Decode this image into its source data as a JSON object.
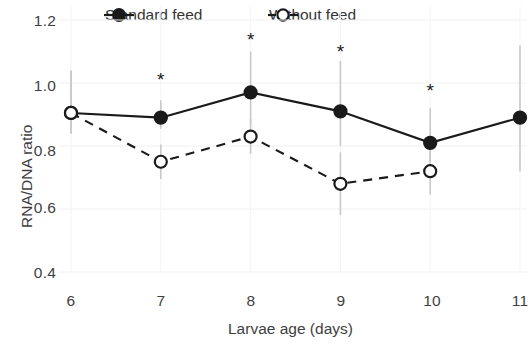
{
  "chart_data": {
    "type": "line",
    "title": "",
    "xlabel": "Larvae age (days)",
    "ylabel": "RNA/DNA ratio",
    "x": [
      6,
      7,
      8,
      9,
      10,
      11
    ],
    "xticklabels": [
      "6",
      "7",
      "8",
      "9",
      "10",
      "11"
    ],
    "yticklabels": [
      "1.2",
      "1.0",
      "0.8",
      "0.6",
      "0.4"
    ],
    "yticks": [
      1.2,
      1.0,
      0.8,
      0.6,
      0.4
    ],
    "xlim": [
      6,
      11
    ],
    "ylim": [
      0.4,
      1.2
    ],
    "grid": "faint-horizontal-and-vertical",
    "legend_position": "top-center",
    "series": [
      {
        "name": "Standard feed",
        "marker": "filled-circle",
        "linestyle": "solid",
        "color": "#1a1a1a",
        "x": [
          6,
          7,
          8,
          9,
          10,
          11
        ],
        "values": [
          0.905,
          0.89,
          0.97,
          0.91,
          0.81,
          0.89
        ],
        "error_low": [
          0.84,
          0.855,
          0.87,
          0.8,
          0.75,
          0.72
        ],
        "error_high": [
          1.04,
          0.945,
          1.1,
          1.07,
          0.92,
          1.12
        ]
      },
      {
        "name": "Without feed",
        "marker": "open-circle",
        "linestyle": "dashed",
        "color": "#1a1a1a",
        "x": [
          6,
          7,
          8,
          9,
          10
        ],
        "values": [
          0.905,
          0.75,
          0.83,
          0.68,
          0.72
        ],
        "error_low": [
          0.84,
          0.695,
          0.775,
          0.58,
          0.645
        ],
        "error_high": [
          1.04,
          0.805,
          0.885,
          0.78,
          0.795
        ]
      }
    ],
    "annotations": [
      {
        "label": "*",
        "x": 7,
        "y": 1.01
      },
      {
        "label": "*",
        "x": 8,
        "y": 1.135
      },
      {
        "label": "*",
        "x": 9,
        "y": 1.1
      },
      {
        "label": "*",
        "x": 10,
        "y": 0.975
      }
    ]
  },
  "legend": {
    "entries": [
      {
        "label": "Standard feed"
      },
      {
        "label": "Without feed"
      }
    ]
  }
}
